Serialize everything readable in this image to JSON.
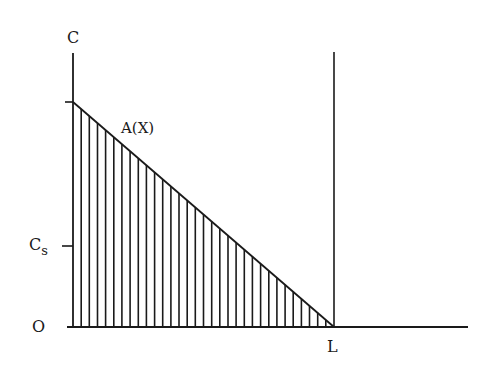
{
  "diagram": {
    "labels": {
      "y_axis": "C",
      "curve": "A(X)",
      "cs_main": "C",
      "cs_sub": "s",
      "origin": "O",
      "x_mark": "L"
    },
    "hatch": {
      "count": 32,
      "description": "vertical hatching under line A(X) from C-axis to L"
    },
    "colors": {
      "ink": "#1a1a1a",
      "background": "#ffffff"
    }
  }
}
